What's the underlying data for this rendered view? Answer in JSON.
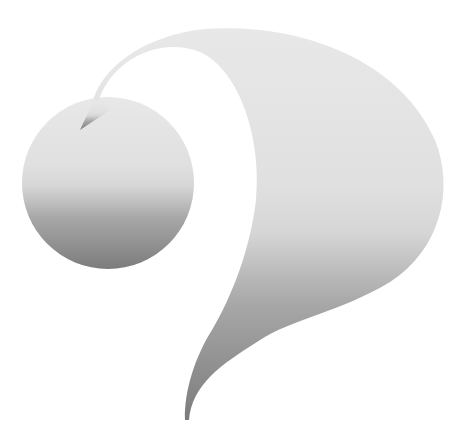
{
  "graphic": {
    "description": "Stylized question-mark shaped gray gradient graphic",
    "colors": {
      "background": "#ffffff",
      "gradient_top": "#e8e8e8",
      "gradient_mid": "#d6d6d6",
      "gradient_low": "#a8a8a8",
      "gradient_tip": "#7c7c7c"
    }
  }
}
